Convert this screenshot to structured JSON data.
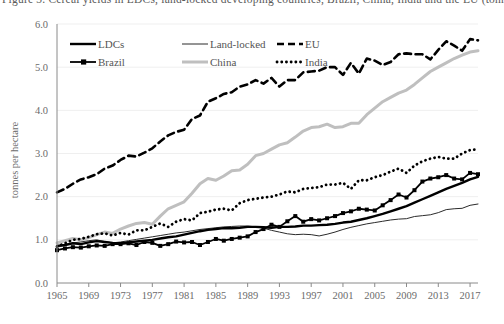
{
  "figure": {
    "cut_off_title": "Figure 3. Cereal yields in LDCs, land-locked developing countries, Brazil, China, India and the EU (tonnes per hectare)",
    "y_axis_title": "tonnes per hectare",
    "x_axis_title": ""
  },
  "axes": {
    "y_ticks": [
      "0.0",
      "1.0",
      "2.0",
      "3.0",
      "4.0",
      "5.0",
      "6.0"
    ],
    "y_tick_values": [
      0,
      1,
      2,
      3,
      4,
      5,
      6
    ],
    "x_ticks": [
      "1965",
      "1969",
      "1973",
      "1977",
      "1981",
      "1985",
      "1989",
      "1993",
      "1997",
      "2001",
      "2005",
      "2009",
      "2013",
      "2017"
    ],
    "x_tick_values": [
      1965,
      1969,
      1973,
      1977,
      1981,
      1985,
      1989,
      1993,
      1997,
      2001,
      2005,
      2009,
      2013,
      2017
    ]
  },
  "legend": {
    "position": "top-left-inside",
    "entries": [
      {
        "label": "LDCs",
        "style": "thick-solid-black",
        "color": "#000000"
      },
      {
        "label": "Land-locked",
        "style": "thin-solid-black",
        "color": "#2b2b2b"
      },
      {
        "label": "EU",
        "style": "dashed-black",
        "color": "#000000"
      },
      {
        "label": "Brazil",
        "style": "solid-black-square-markers",
        "color": "#000000"
      },
      {
        "label": "China",
        "style": "thick-solid-gray",
        "color": "#bfbfbf"
      },
      {
        "label": "India",
        "style": "dotted-black",
        "color": "#000000"
      }
    ]
  },
  "chart_data": {
    "type": "line",
    "title": "Cereal yields in LDCs, land-locked developing countries, Brazil, China, India and the EU",
    "xlabel": "",
    "ylabel": "tonnes per hectare",
    "xlim": [
      1965,
      2018
    ],
    "ylim": [
      0.0,
      6.0
    ],
    "grid": "horizontal-faint",
    "legend_position": "upper-left",
    "x": [
      1965,
      1966,
      1967,
      1968,
      1969,
      1970,
      1971,
      1972,
      1973,
      1974,
      1975,
      1976,
      1977,
      1978,
      1979,
      1980,
      1981,
      1982,
      1983,
      1984,
      1985,
      1986,
      1987,
      1988,
      1989,
      1990,
      1991,
      1992,
      1993,
      1994,
      1995,
      1996,
      1997,
      1998,
      1999,
      2000,
      2001,
      2002,
      2003,
      2004,
      2005,
      2006,
      2007,
      2008,
      2009,
      2010,
      2011,
      2012,
      2013,
      2014,
      2015,
      2016,
      2017,
      2018
    ],
    "series": [
      {
        "name": "LDCs",
        "color": "#000000",
        "line": "solid",
        "width": 2.4,
        "values": [
          0.86,
          0.88,
          0.92,
          0.9,
          0.94,
          0.97,
          0.95,
          0.93,
          0.92,
          0.94,
          0.96,
          0.98,
          1.0,
          1.03,
          1.06,
          1.08,
          1.12,
          1.16,
          1.2,
          1.23,
          1.25,
          1.27,
          1.27,
          1.28,
          1.3,
          1.3,
          1.29,
          1.28,
          1.3,
          1.3,
          1.31,
          1.33,
          1.33,
          1.34,
          1.35,
          1.37,
          1.4,
          1.42,
          1.46,
          1.5,
          1.55,
          1.6,
          1.66,
          1.72,
          1.78,
          1.86,
          1.94,
          2.02,
          2.1,
          2.18,
          2.25,
          2.32,
          2.4,
          2.46
        ]
      },
      {
        "name": "Land-locked",
        "color": "#2b2b2b",
        "line": "solid",
        "width": 1.0,
        "values": [
          0.83,
          0.87,
          0.93,
          0.95,
          0.98,
          1.0,
          0.96,
          0.93,
          0.95,
          0.98,
          1.01,
          1.04,
          1.07,
          1.1,
          1.13,
          1.16,
          1.18,
          1.21,
          1.24,
          1.26,
          1.28,
          1.3,
          1.31,
          1.32,
          1.32,
          1.3,
          1.27,
          1.22,
          1.18,
          1.14,
          1.12,
          1.13,
          1.12,
          1.09,
          1.13,
          1.18,
          1.24,
          1.29,
          1.33,
          1.37,
          1.4,
          1.43,
          1.46,
          1.48,
          1.49,
          1.54,
          1.56,
          1.58,
          1.63,
          1.7,
          1.72,
          1.73,
          1.8,
          1.83
        ]
      },
      {
        "name": "EU",
        "color": "#000000",
        "line": "dashed",
        "width": 2.6,
        "values": [
          2.1,
          2.18,
          2.3,
          2.4,
          2.45,
          2.52,
          2.65,
          2.72,
          2.85,
          2.95,
          2.93,
          3.02,
          3.12,
          3.28,
          3.42,
          3.5,
          3.55,
          3.8,
          3.88,
          4.2,
          4.28,
          4.38,
          4.42,
          4.55,
          4.6,
          4.7,
          4.62,
          4.75,
          4.55,
          4.7,
          4.7,
          4.88,
          4.9,
          4.92,
          5.0,
          5.0,
          4.82,
          5.1,
          4.85,
          5.2,
          5.15,
          5.05,
          5.12,
          5.3,
          5.32,
          5.3,
          5.3,
          5.18,
          5.4,
          5.6,
          5.5,
          5.38,
          5.65,
          5.62
        ]
      },
      {
        "name": "Brazil",
        "color": "#000000",
        "line": "solid-markers",
        "width": 1.8,
        "marker": "square",
        "values": [
          0.76,
          0.8,
          0.83,
          0.82,
          0.85,
          0.87,
          0.86,
          0.9,
          0.9,
          0.92,
          0.88,
          0.95,
          0.93,
          0.86,
          0.9,
          0.96,
          0.94,
          0.95,
          0.88,
          0.95,
          1.02,
          0.98,
          1.02,
          1.05,
          1.08,
          1.18,
          1.25,
          1.35,
          1.3,
          1.43,
          1.55,
          1.42,
          1.48,
          1.45,
          1.5,
          1.55,
          1.62,
          1.66,
          1.72,
          1.7,
          1.68,
          1.8,
          1.92,
          2.05,
          1.98,
          2.15,
          2.35,
          2.42,
          2.45,
          2.5,
          2.42,
          2.4,
          2.55,
          2.52
        ]
      },
      {
        "name": "China",
        "color": "#bfbfbf",
        "line": "solid",
        "width": 3.0,
        "values": [
          0.93,
          0.98,
          1.03,
          1.0,
          1.05,
          1.12,
          1.18,
          1.15,
          1.25,
          1.32,
          1.38,
          1.4,
          1.36,
          1.55,
          1.72,
          1.8,
          1.88,
          2.08,
          2.3,
          2.42,
          2.38,
          2.48,
          2.6,
          2.62,
          2.75,
          2.95,
          3.0,
          3.1,
          3.2,
          3.25,
          3.38,
          3.52,
          3.6,
          3.62,
          3.68,
          3.6,
          3.62,
          3.7,
          3.7,
          3.9,
          4.05,
          4.2,
          4.3,
          4.4,
          4.47,
          4.6,
          4.75,
          4.9,
          5.0,
          5.1,
          5.2,
          5.28,
          5.35,
          5.38
        ]
      },
      {
        "name": "India",
        "color": "#000000",
        "line": "dotted",
        "width": 2.8,
        "values": [
          0.84,
          0.92,
          1.0,
          1.02,
          1.07,
          1.13,
          1.15,
          1.1,
          1.16,
          1.12,
          1.22,
          1.22,
          1.3,
          1.38,
          1.3,
          1.42,
          1.48,
          1.45,
          1.62,
          1.65,
          1.7,
          1.72,
          1.68,
          1.85,
          1.92,
          1.95,
          1.98,
          2.0,
          2.05,
          2.12,
          2.1,
          2.18,
          2.2,
          2.22,
          2.28,
          2.28,
          2.32,
          2.18,
          2.38,
          2.38,
          2.45,
          2.5,
          2.58,
          2.65,
          2.55,
          2.72,
          2.82,
          2.88,
          2.92,
          2.88,
          2.88,
          3.0,
          3.08,
          3.1
        ]
      }
    ]
  }
}
